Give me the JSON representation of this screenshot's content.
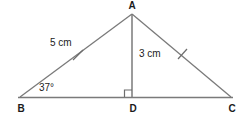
{
  "figure": {
    "type": "geometry-diagram",
    "shape": "triangle-with-altitude",
    "background_color": "#ffffff",
    "stroke_color": "#7a7a7a",
    "text_color": "#1b1b1b"
  },
  "vertices": {
    "apex": {
      "label": "A",
      "x": 132,
      "y": 14,
      "label_x": 132,
      "label_y": 9
    },
    "left": {
      "label": "B",
      "x": 20,
      "y": 97,
      "label_x": 21,
      "label_y": 111
    },
    "foot": {
      "label": "D",
      "x": 132,
      "y": 97,
      "label_x": 133,
      "label_y": 111
    },
    "right": {
      "label": "C",
      "x": 231,
      "y": 97,
      "label_x": 232,
      "label_y": 111
    }
  },
  "measurements": {
    "side_ab": {
      "label": "5 cm",
      "x": 50,
      "y": 46
    },
    "altitude_ad": {
      "label": "3 cm",
      "x": 139,
      "y": 57
    },
    "angle_b": {
      "label": "37°",
      "x": 39,
      "y": 91
    }
  },
  "marks": {
    "tick_ab": {
      "name": "congruence-tick",
      "x": 78,
      "y": 55
    },
    "tick_ac": {
      "name": "congruence-tick",
      "x": 182,
      "y": 54
    },
    "right_angle_d": {
      "name": "right-angle-square",
      "x": 124,
      "y": 89,
      "size": 7
    }
  }
}
